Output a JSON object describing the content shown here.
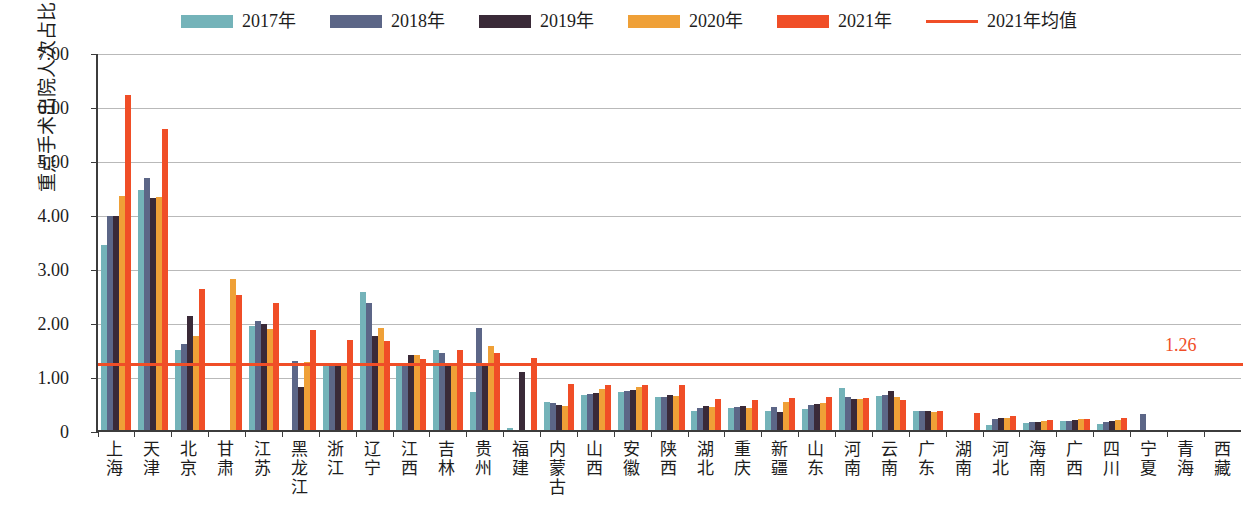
{
  "chart_data": {
    "type": "bar",
    "title": "",
    "subtitle": "",
    "xlabel": "",
    "ylabel": "重点手术出院人次占比（%）",
    "ylim": [
      0,
      7.0
    ],
    "ytick_labels": [
      "7.00",
      "6.00",
      "5.00",
      "4.00",
      "3.00",
      "2.00",
      "1.00",
      "0"
    ],
    "ytick_values": [
      7.0,
      6.0,
      5.0,
      4.0,
      3.0,
      2.0,
      1.0,
      0
    ],
    "grid": true,
    "legend_position": "top-center",
    "categories": [
      "上海",
      "天津",
      "北京",
      "甘肃",
      "江苏",
      "黑龙江",
      "浙江",
      "辽宁",
      "江西",
      "吉林",
      "贵州",
      "福建",
      "内蒙古",
      "山西",
      "安徽",
      "陕西",
      "湖北",
      "重庆",
      "新疆",
      "山东",
      "河南",
      "云南",
      "广东",
      "湖南",
      "河北",
      "海南",
      "广西",
      "四川",
      "宁夏",
      "青海",
      "西藏"
    ],
    "series": [
      {
        "name": "2017年",
        "color": "#74B3B9",
        "values": [
          3.43,
          4.44,
          1.49,
          0,
          1.93,
          0,
          1.21,
          2.56,
          1.25,
          1.48,
          0.7,
          0.04,
          0.52,
          0.64,
          0.7,
          0.61,
          0.35,
          0.41,
          0.36,
          0.39,
          0.77,
          0.63,
          0.36,
          0,
          0.09,
          0.13,
          0.16,
          0.11,
          0,
          0,
          0
        ]
      },
      {
        "name": "2018年",
        "color": "#5C6687",
        "values": [
          3.96,
          4.66,
          1.6,
          0,
          2.02,
          1.28,
          1.22,
          2.36,
          1.25,
          1.43,
          1.88,
          0,
          0.5,
          0.66,
          0.72,
          0.62,
          0.41,
          0.43,
          0.43,
          0.46,
          0.62,
          0.65,
          0.35,
          0,
          0.2,
          0.14,
          0.17,
          0.14,
          0.3,
          0,
          0
        ]
      },
      {
        "name": "2019年",
        "color": "#3A2A38",
        "values": [
          3.97,
          4.3,
          2.12,
          0,
          1.96,
          0.79,
          1.22,
          1.75,
          1.38,
          1.24,
          1.25,
          1.08,
          0.47,
          0.69,
          0.74,
          0.64,
          0.45,
          0.44,
          0.33,
          0.49,
          0.58,
          0.73,
          0.36,
          0,
          0.22,
          0.14,
          0.18,
          0.16,
          0,
          0,
          0
        ]
      },
      {
        "name": "2020年",
        "color": "#EFA037",
        "values": [
          4.33,
          4.31,
          1.74,
          2.8,
          1.87,
          1.26,
          1.24,
          1.88,
          1.38,
          1.23,
          1.55,
          0,
          0.44,
          0.76,
          0.8,
          0.63,
          0.43,
          0.4,
          0.52,
          0.5,
          0.57,
          0.62,
          0.34,
          0,
          0.22,
          0.16,
          0.2,
          0.19,
          0,
          0,
          0
        ]
      },
      {
        "name": "2021年",
        "color": "#F04E27",
        "values": [
          6.21,
          5.58,
          2.61,
          2.5,
          2.35,
          1.85,
          1.67,
          1.65,
          1.31,
          1.48,
          1.43,
          1.33,
          0.85,
          0.84,
          0.83,
          0.83,
          0.57,
          0.56,
          0.59,
          0.62,
          0.59,
          0.56,
          0.36,
          0.31,
          0.26,
          0.19,
          0.21,
          0.22,
          0,
          0,
          0
        ]
      }
    ],
    "average_line": {
      "name": "2021年均值",
      "value": 1.26,
      "label": "1.26",
      "color": "#F04E27"
    }
  },
  "legend": {
    "items": [
      {
        "label": "2017年",
        "color": "#74B3B9",
        "kind": "swatch"
      },
      {
        "label": "2018年",
        "color": "#5C6687",
        "kind": "swatch"
      },
      {
        "label": "2019年",
        "color": "#3A2A38",
        "kind": "swatch"
      },
      {
        "label": "2020年",
        "color": "#EFA037",
        "kind": "swatch"
      },
      {
        "label": "2021年",
        "color": "#F04E27",
        "kind": "swatch"
      },
      {
        "label": "2021年均值",
        "color": "#F04E27",
        "kind": "line"
      }
    ]
  }
}
